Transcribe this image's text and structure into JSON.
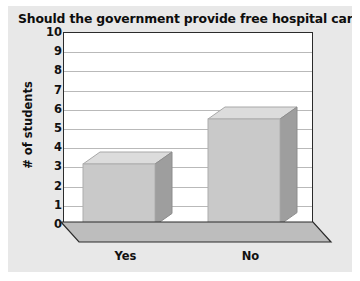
{
  "chart_data": {
    "type": "bar",
    "title": "Should the government provide free hospital care?",
    "xlabel": "",
    "ylabel": "# of students",
    "categories": [
      "Yes",
      "No"
    ],
    "values": [
      3.2,
      5.5
    ],
    "ylim": [
      0,
      10
    ],
    "ytick_labels": [
      "10",
      "9",
      "8",
      "7",
      "6",
      "5",
      "4",
      "3",
      "2",
      "1",
      "0"
    ],
    "ytick_values": [
      10,
      9,
      8,
      7,
      6,
      5,
      4,
      3,
      2,
      1,
      0
    ],
    "grid": true,
    "legend": false,
    "style": "3d-column",
    "colors": {
      "bar_front": "#c9c9c9",
      "bar_top": "#dcdcdc",
      "bar_side": "#9e9e9e",
      "floor": "#bdbdbd",
      "plot_background": "#ffffff",
      "frame_background": "#e8e8e8",
      "axis": "#2b2b2b",
      "gridline": "#b9b9b9",
      "text": "#111111"
    }
  }
}
